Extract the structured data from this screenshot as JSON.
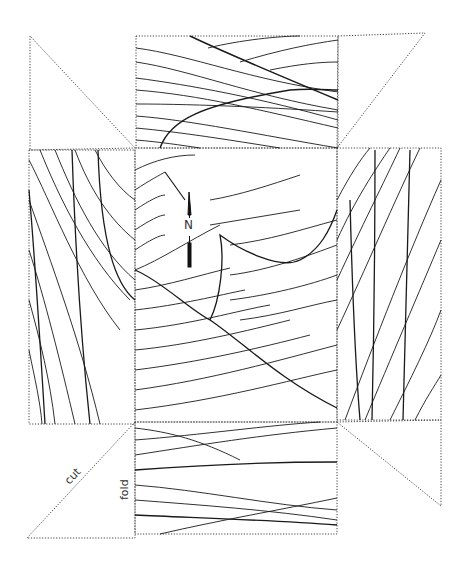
{
  "diagram": {
    "title": "",
    "labels": {
      "north": "N",
      "cut": "cut",
      "fold": "fold"
    },
    "colors": {
      "line": "#1a1a1a",
      "fold_dots": "#444444",
      "background": "#ffffff"
    },
    "panels": [
      "top",
      "left",
      "center",
      "right",
      "bottom"
    ],
    "corner_triangles": [
      "top-left",
      "top-right",
      "bottom-left",
      "bottom-right"
    ]
  }
}
